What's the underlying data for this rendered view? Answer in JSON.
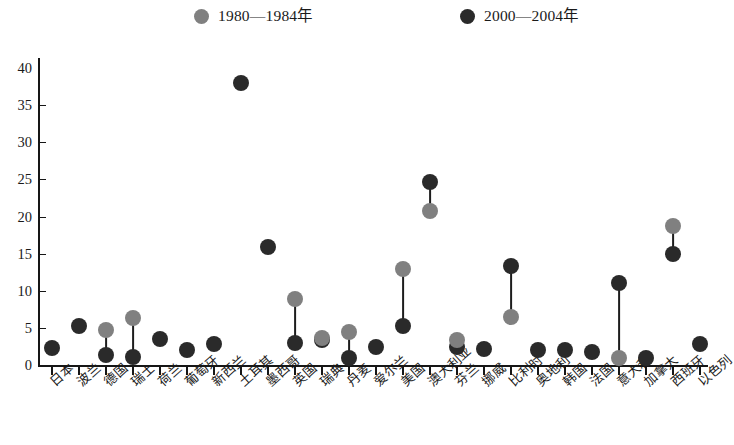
{
  "legend": {
    "position": "top",
    "entries": [
      {
        "label": "1980—1984年",
        "color": "#808080",
        "icon": "circle-marker-icon"
      },
      {
        "label": "2000—2004年",
        "color": "#2a2a2a",
        "icon": "circle-marker-icon"
      }
    ]
  },
  "colors": {
    "early": "#808080",
    "late": "#2a2a2a",
    "axis": "#161616",
    "connector": "#1d1d1d",
    "background": "#ffffff"
  },
  "chart_data": {
    "type": "scatter",
    "title": "",
    "subtitle": "",
    "xlabel": "",
    "ylabel": "",
    "ylim": [
      0,
      40
    ],
    "yticks": [
      0,
      5,
      10,
      15,
      20,
      25,
      30,
      35,
      40
    ],
    "ytick_labels": [
      "0",
      "5",
      "10",
      "15",
      "20",
      "25",
      "30",
      "35",
      "40"
    ],
    "grid": false,
    "legend_position": "top",
    "categories": [
      "日本",
      "波兰",
      "德国",
      "瑞士",
      "荷兰",
      "葡萄牙",
      "新西兰",
      "土耳其",
      "墨西哥",
      "英国",
      "瑞典",
      "丹麦",
      "爱尔兰",
      "美国",
      "澳大利亚",
      "芬兰",
      "挪威",
      "比利时",
      "奥地利",
      "韩国",
      "法国",
      "意大利",
      "加拿大",
      "西班牙",
      "以色列"
    ],
    "series": [
      {
        "name": "1980—1984年",
        "color": "#808080",
        "values": [
          null,
          null,
          4.7,
          6.3,
          null,
          null,
          null,
          null,
          null,
          8.9,
          3.7,
          4.5,
          null,
          12.9,
          20.8,
          3.3,
          null,
          6.5,
          null,
          null,
          null,
          1.0,
          null,
          18.7,
          null
        ]
      },
      {
        "name": "2000—2004年",
        "color": "#2a2a2a",
        "values": [
          2.3,
          5.2,
          1.3,
          1.1,
          3.5,
          2.0,
          2.8,
          38.0,
          15.9,
          3.0,
          3.4,
          1.0,
          2.4,
          5.2,
          24.6,
          2.4,
          2.1,
          13.3,
          2.0,
          2.0,
          1.8,
          11.1,
          1.0,
          15.0,
          2.8
        ]
      }
    ]
  }
}
